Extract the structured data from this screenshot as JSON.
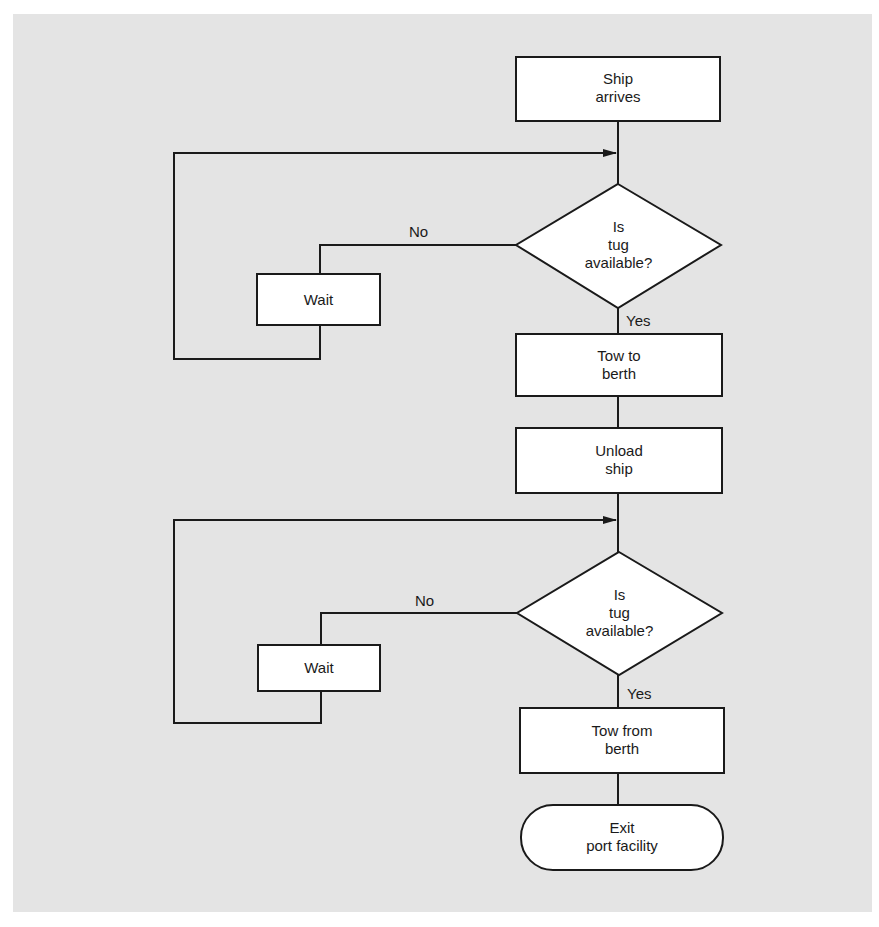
{
  "colors": {
    "background_panel": "#e4e4e4",
    "page": "#ffffff",
    "stroke": "#1a1a1a",
    "node_fill": "#ffffff"
  },
  "flowchart": {
    "nodes": [
      {
        "id": "ship_arrives",
        "type": "process",
        "text": "Ship\narrives"
      },
      {
        "id": "decision_1",
        "type": "decision",
        "text": "Is\ntug\navailable?"
      },
      {
        "id": "wait_1",
        "type": "process",
        "text": "Wait"
      },
      {
        "id": "tow_to_berth",
        "type": "process",
        "text": "Tow to\nberth"
      },
      {
        "id": "unload_ship",
        "type": "process",
        "text": "Unload\nship"
      },
      {
        "id": "decision_2",
        "type": "decision",
        "text": "Is\ntug\navailable?"
      },
      {
        "id": "wait_2",
        "type": "process",
        "text": "Wait"
      },
      {
        "id": "tow_from_berth",
        "type": "process",
        "text": "Tow from\nberth"
      },
      {
        "id": "exit",
        "type": "terminal",
        "text": "Exit\nport facility"
      }
    ],
    "edges": [
      {
        "from": "ship_arrives",
        "to": "decision_1",
        "label": ""
      },
      {
        "from": "decision_1",
        "to": "wait_1",
        "label": "No"
      },
      {
        "from": "wait_1",
        "to": "decision_1",
        "label": ""
      },
      {
        "from": "decision_1",
        "to": "tow_to_berth",
        "label": "Yes"
      },
      {
        "from": "tow_to_berth",
        "to": "unload_ship",
        "label": ""
      },
      {
        "from": "unload_ship",
        "to": "decision_2",
        "label": ""
      },
      {
        "from": "decision_2",
        "to": "wait_2",
        "label": "No"
      },
      {
        "from": "wait_2",
        "to": "decision_2",
        "label": ""
      },
      {
        "from": "decision_2",
        "to": "tow_from_berth",
        "label": "Yes"
      },
      {
        "from": "tow_from_berth",
        "to": "exit",
        "label": ""
      }
    ],
    "labels": {
      "no": "No",
      "yes": "Yes"
    }
  }
}
